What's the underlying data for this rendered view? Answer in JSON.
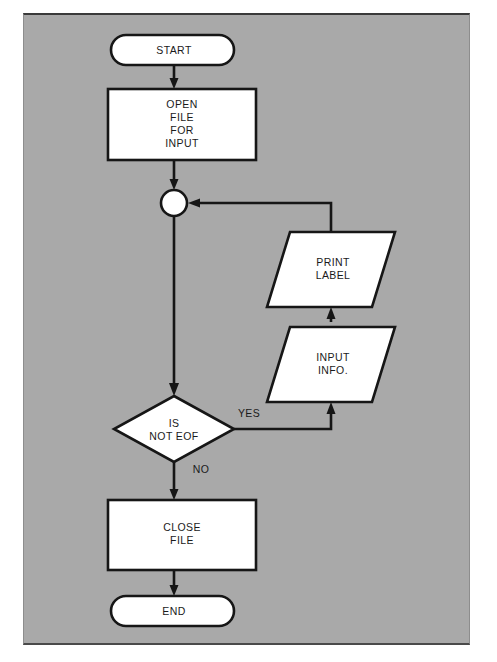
{
  "figure": {
    "type": "flowchart",
    "background_color": "#a9a9a9",
    "shape_fill": "#ffffff",
    "line_color": "#161616"
  },
  "nodes": {
    "start": {
      "shape": "terminator",
      "label": "START"
    },
    "open_file": {
      "shape": "process",
      "label_line1": "OPEN",
      "label_line2": "FILE",
      "label_line3": "FOR",
      "label_line4": "INPUT"
    },
    "junction": {
      "shape": "connector",
      "label": ""
    },
    "print_label": {
      "shape": "io-parallelogram",
      "label_line1": "PRINT",
      "label_line2": "LABEL"
    },
    "input_info": {
      "shape": "io-parallelogram",
      "label_line1": "INPUT",
      "label_line2": "INFO."
    },
    "decision": {
      "shape": "decision",
      "label_line1": "IS",
      "label_line2": "NOT EOF"
    },
    "close_file": {
      "shape": "process",
      "label_line1": "CLOSE",
      "label_line2": "FILE"
    },
    "end": {
      "shape": "terminator",
      "label": "END"
    }
  },
  "edge_labels": {
    "yes": "YES",
    "no": "NO"
  }
}
